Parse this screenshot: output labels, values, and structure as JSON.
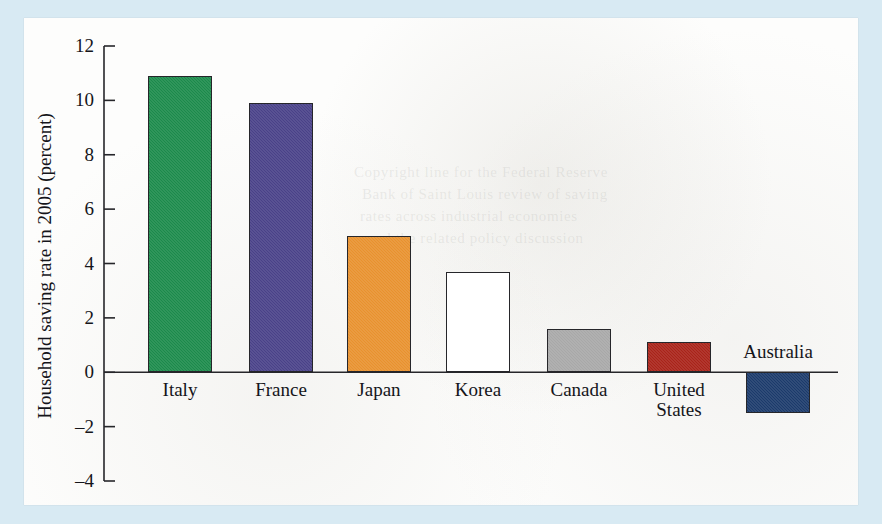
{
  "figure": {
    "background_color": "#d8eaf3",
    "paper_color": "#fdfdfc",
    "axis_color": "#26262a"
  },
  "chart_data": {
    "type": "bar",
    "title": "",
    "xlabel": "",
    "ylabel": "Household saving rate in 2005 (percent)",
    "ylim": [
      -4,
      12
    ],
    "ytick_labels": [
      "12",
      "10",
      "8",
      "6",
      "4",
      "2",
      "0",
      "–2",
      "–4"
    ],
    "ytick_values": [
      12,
      10,
      8,
      6,
      4,
      2,
      0,
      -2,
      -4
    ],
    "grid": false,
    "legend": "none",
    "categories": [
      "Italy",
      "France",
      "Japan",
      "Korea",
      "Canada",
      "United States",
      "Australia"
    ],
    "values": [
      10.9,
      9.9,
      5.0,
      3.7,
      1.6,
      1.1,
      -1.5
    ],
    "bar_colors": [
      "#1b8a4b",
      "#494188",
      "#e8912e",
      "#ffffff",
      "#a8a8a8",
      "#a92319",
      "#1b3a6b"
    ],
    "series": [
      {
        "name": "Household saving rate 2005",
        "points": [
          {
            "category": "Italy",
            "label_lines": [
              "Italy"
            ],
            "value": 10.9,
            "color": "#1b8a4b"
          },
          {
            "category": "France",
            "label_lines": [
              "France"
            ],
            "value": 9.9,
            "color": "#494188"
          },
          {
            "category": "Japan",
            "label_lines": [
              "Japan"
            ],
            "value": 5.0,
            "color": "#e8912e"
          },
          {
            "category": "Korea",
            "label_lines": [
              "Korea"
            ],
            "value": 3.7,
            "color": "#ffffff"
          },
          {
            "category": "Canada",
            "label_lines": [
              "Canada"
            ],
            "value": 1.6,
            "color": "#a8a8a8"
          },
          {
            "category": "United States",
            "label_lines": [
              "United",
              "States"
            ],
            "value": 1.1,
            "color": "#a92319"
          },
          {
            "category": "Australia",
            "label_lines": [
              "Australia"
            ],
            "value": -1.5,
            "color": "#1b3a6b"
          }
        ]
      }
    ]
  },
  "bleed_through": {
    "lines": [
      "Copyright line for the Federal Reserve",
      "Bank of Saint Louis review of saving",
      "rates across industrial economies",
      "and the related policy discussion"
    ]
  }
}
